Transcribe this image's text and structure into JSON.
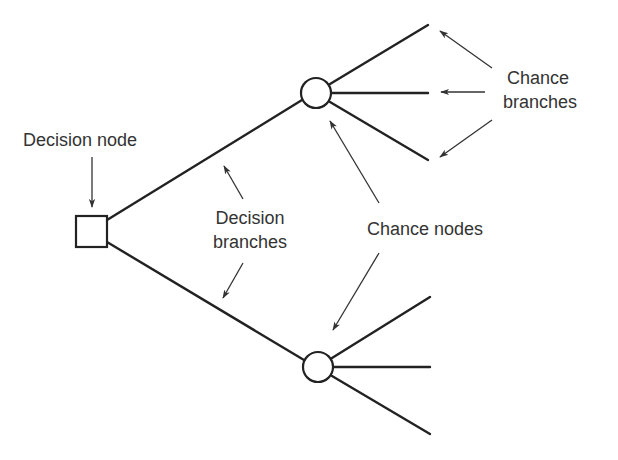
{
  "diagram": {
    "type": "decision-tree",
    "labels": {
      "decision_node": "Decision node",
      "decision_branches_line1": "Decision",
      "decision_branches_line2": "branches",
      "chance_nodes": "Chance nodes",
      "chance_branches_line1": "Chance",
      "chance_branches_line2": "branches"
    },
    "nodes": [
      {
        "id": "decision",
        "shape": "square",
        "label": "Decision node"
      },
      {
        "id": "chance-upper",
        "shape": "circle"
      },
      {
        "id": "chance-lower",
        "shape": "circle"
      }
    ],
    "edges": [
      {
        "from": "decision",
        "to": "chance-upper",
        "kind": "decision branch"
      },
      {
        "from": "decision",
        "to": "chance-lower",
        "kind": "decision branch"
      },
      {
        "from": "chance-upper",
        "to": "outcome-1",
        "kind": "chance branch"
      },
      {
        "from": "chance-upper",
        "to": "outcome-2",
        "kind": "chance branch"
      },
      {
        "from": "chance-upper",
        "to": "outcome-3",
        "kind": "chance branch"
      },
      {
        "from": "chance-lower",
        "to": "outcome-4",
        "kind": "chance branch"
      },
      {
        "from": "chance-lower",
        "to": "outcome-5",
        "kind": "chance branch"
      },
      {
        "from": "chance-lower",
        "to": "outcome-6",
        "kind": "chance branch"
      }
    ],
    "colors": {
      "line": "#222222",
      "text": "#333333",
      "background": "#ffffff"
    }
  }
}
